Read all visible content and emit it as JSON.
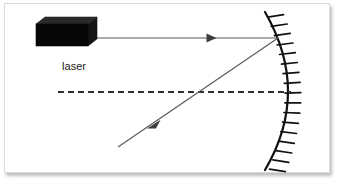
{
  "figure": {
    "background_color": "#ffffff",
    "frame_border_color": "#dcdcdc",
    "ink_color": "#3a3a3a",
    "mirror_color": "#111111",
    "laser_body_color": "#0b0b0b",
    "laser_top_color": "#2a2a2a",
    "laser_side_color": "#181818"
  },
  "labels": {
    "laser": "laser"
  },
  "elements": {
    "laser_source": {
      "name": "laser",
      "front_face": {
        "x": 36,
        "y": 24,
        "width": 52,
        "height": 22
      },
      "depth_offset": {
        "dx": 9,
        "dy": -7
      }
    },
    "incident_ray": {
      "name": "incident-ray",
      "from": {
        "x": 88,
        "y": 38
      },
      "to": {
        "x": 278,
        "y": 38
      },
      "arrow_at": {
        "x": 214,
        "y": 38
      },
      "direction": "right"
    },
    "reflected_ray": {
      "name": "reflected-ray",
      "from": {
        "x": 278,
        "y": 38
      },
      "to": {
        "x": 118,
        "y": 147
      },
      "arrow_at": {
        "x": 155,
        "y": 122
      },
      "direction": "down-left"
    },
    "optical_axis": {
      "name": "optical-axis",
      "from": {
        "x": 58,
        "y": 92
      },
      "to": {
        "x": 292,
        "y": 92
      },
      "style": "dashed",
      "dash_pattern": "6 4"
    },
    "mirror": {
      "name": "concave-mirror",
      "top": {
        "x": 265,
        "y": 12
      },
      "vertex": {
        "x": 293,
        "y": 92
      },
      "bottom": {
        "x": 265,
        "y": 170
      },
      "curvature": "concave-toward-left",
      "hatch_count": 17,
      "hatch_length": 16,
      "hatch_side": "right"
    },
    "reflection_point": {
      "x": 278,
      "y": 38
    }
  }
}
